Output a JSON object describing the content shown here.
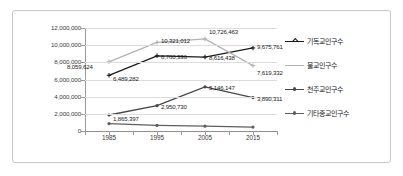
{
  "chart_data": {
    "type": "line",
    "title": "",
    "xlabel": "",
    "ylabel": "",
    "categories": [
      "1985",
      "1995",
      "2005",
      "2015"
    ],
    "ylim": [
      0,
      12000000
    ],
    "ytick_labels": [
      "12,000,000",
      "10,000,000",
      "8,000,000",
      "6,000,000",
      "4,000,000",
      "2,000,000",
      "0"
    ],
    "ytick_values": [
      12000000,
      10000000,
      8000000,
      6000000,
      4000000,
      2000000,
      0
    ],
    "grid": true,
    "legend_position": "right",
    "series": [
      {
        "name": "기독교인구수",
        "color": "#1a1a1a",
        "values": [
          6489282,
          8760336,
          8616438,
          9675761
        ],
        "labels": [
          "6,489,282",
          "8,760,336",
          "8,616,438",
          "9,675,761"
        ]
      },
      {
        "name": "불교인구수",
        "color": "#b3b3b3",
        "values": [
          8059624,
          10321012,
          10726463,
          7619332
        ],
        "labels": [
          "8,059,624",
          "10,321,012",
          "10,726,463",
          "7,619,332"
        ]
      },
      {
        "name": "천주교인구수",
        "color": "#474747",
        "values": [
          1865397,
          2950730,
          5146147,
          3890311
        ],
        "labels": [
          "1,865,397",
          "2,950,730",
          "5,146,147",
          "3,890,311"
        ]
      },
      {
        "name": "기타종교인구수",
        "color": "#5e5e5e",
        "values": [
          850000,
          650000,
          560000,
          460000
        ],
        "labels": [
          "",
          "",
          "",
          ""
        ]
      }
    ]
  },
  "legend": {
    "items": [
      {
        "label": "기독교인구수"
      },
      {
        "label": "불교인구수"
      },
      {
        "label": "천주교인구수"
      },
      {
        "label": "기타종교인구수"
      }
    ]
  }
}
